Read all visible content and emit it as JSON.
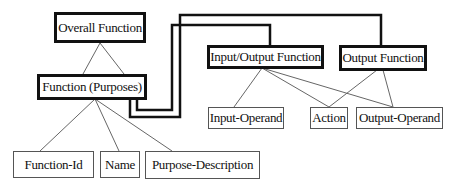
{
  "diagram": {
    "type": "hierarchy",
    "nodes": [
      {
        "id": "overall",
        "label": "Overall Function",
        "style": "thick"
      },
      {
        "id": "purposes",
        "label": "Function (Purposes)",
        "style": "thick"
      },
      {
        "id": "io",
        "label": "Input/Output Function",
        "style": "thick"
      },
      {
        "id": "out",
        "label": "Output Function",
        "style": "thick"
      },
      {
        "id": "input_operand",
        "label": "Input-Operand",
        "style": "thin"
      },
      {
        "id": "action",
        "label": "Action",
        "style": "thin"
      },
      {
        "id": "output_operand",
        "label": "Output-Operand",
        "style": "thin"
      },
      {
        "id": "function_id",
        "label": "Function-Id",
        "style": "thin"
      },
      {
        "id": "name",
        "label": "Name",
        "style": "thin"
      },
      {
        "id": "purpose_description",
        "label": "Purpose-Description",
        "style": "thin"
      }
    ],
    "edges": [
      {
        "from": "overall",
        "to": "purposes",
        "style": "thin"
      },
      {
        "from": "purposes",
        "to": "function_id",
        "style": "thin"
      },
      {
        "from": "purposes",
        "to": "name",
        "style": "thin"
      },
      {
        "from": "purposes",
        "to": "purpose_description",
        "style": "thin"
      },
      {
        "from": "purposes",
        "to": "io",
        "style": "thick-connector"
      },
      {
        "from": "purposes",
        "to": "out",
        "style": "thick-connector"
      },
      {
        "from": "io",
        "to": "input_operand",
        "style": "thin"
      },
      {
        "from": "io",
        "to": "action",
        "style": "thin"
      },
      {
        "from": "io",
        "to": "output_operand",
        "style": "thin"
      },
      {
        "from": "out",
        "to": "action",
        "style": "thin"
      },
      {
        "from": "out",
        "to": "output_operand",
        "style": "thin"
      }
    ]
  }
}
